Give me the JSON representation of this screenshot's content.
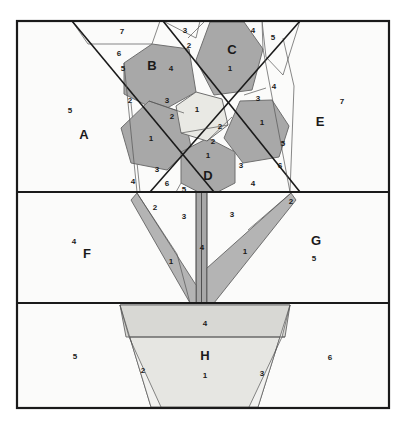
{
  "diagram": {
    "type": "quilt-foundation-piecing-diagram",
    "colors": {
      "background": "#ffffff",
      "block_fill": "#fbfbfa",
      "petal_fill": "#a8a8a8",
      "petal_stroke": "#6f6f6f",
      "leaf_fill": "#b4b4b4",
      "center_fill": "#e9e9e4",
      "pot_fill": "#e6e6e2",
      "pot_band_fill": "#d8d8d4",
      "outline": "#1a1a1a",
      "thin_line": "#444444",
      "text": "#1a1a1a"
    },
    "frame": {
      "x": 17,
      "y": 21,
      "width": 372,
      "height": 387
    },
    "dividers": [
      192,
      303
    ]
  },
  "sections": [
    {
      "id": "A",
      "label": "A",
      "x": 84,
      "y": 136,
      "piece": "5",
      "piece_x": 70,
      "piece_y": 111
    },
    {
      "id": "B",
      "label": "B",
      "x": 152,
      "y": 67,
      "piece": "4",
      "piece_x": 171,
      "piece_y": 69
    },
    {
      "id": "C",
      "label": "C",
      "x": 232,
      "y": 51,
      "piece": "1",
      "piece_x": 230,
      "piece_y": 69
    },
    {
      "id": "D",
      "label": "D",
      "x": 208,
      "y": 177,
      "piece": "1",
      "piece_x": 208,
      "piece_y": 156
    },
    {
      "id": "E",
      "label": "E",
      "x": 320,
      "y": 123,
      "piece": "7",
      "piece_x": 342,
      "piece_y": 102
    },
    {
      "id": "F",
      "label": "F",
      "x": 87,
      "y": 255,
      "piece": "4",
      "piece_x": 74,
      "piece_y": 242
    },
    {
      "id": "G",
      "label": "G",
      "x": 316,
      "y": 242,
      "piece": "5",
      "piece_x": 314,
      "piece_y": 259
    },
    {
      "id": "H",
      "label": "H",
      "x": 205,
      "y": 357,
      "piece": "1",
      "piece_x": 205,
      "piece_y": 376
    }
  ],
  "piece_numbers": [
    {
      "n": "7",
      "x": 122,
      "y": 32
    },
    {
      "n": "6",
      "x": 119,
      "y": 54
    },
    {
      "n": "5",
      "x": 123,
      "y": 69
    },
    {
      "n": "3",
      "x": 185,
      "y": 31
    },
    {
      "n": "2",
      "x": 189,
      "y": 46
    },
    {
      "n": "4",
      "x": 253,
      "y": 31
    },
    {
      "n": "5",
      "x": 273,
      "y": 38
    },
    {
      "n": "4",
      "x": 274,
      "y": 87
    },
    {
      "n": "3",
      "x": 258,
      "y": 99
    },
    {
      "n": "2",
      "x": 130,
      "y": 101
    },
    {
      "n": "3",
      "x": 167,
      "y": 101
    },
    {
      "n": "2",
      "x": 172,
      "y": 117
    },
    {
      "n": "1",
      "x": 197,
      "y": 110
    },
    {
      "n": "1",
      "x": 151,
      "y": 139
    },
    {
      "n": "2",
      "x": 220,
      "y": 127
    },
    {
      "n": "2",
      "x": 213,
      "y": 142
    },
    {
      "n": "1",
      "x": 262,
      "y": 123
    },
    {
      "n": "5",
      "x": 283,
      "y": 144
    },
    {
      "n": "6",
      "x": 280,
      "y": 166
    },
    {
      "n": "3",
      "x": 157,
      "y": 170
    },
    {
      "n": "4",
      "x": 133,
      "y": 182
    },
    {
      "n": "6",
      "x": 167,
      "y": 184
    },
    {
      "n": "5",
      "x": 184,
      "y": 190
    },
    {
      "n": "3",
      "x": 241,
      "y": 166
    },
    {
      "n": "4",
      "x": 253,
      "y": 184
    },
    {
      "n": "2",
      "x": 155,
      "y": 208
    },
    {
      "n": "3",
      "x": 184,
      "y": 217
    },
    {
      "n": "1",
      "x": 171,
      "y": 262
    },
    {
      "n": "4",
      "x": 202,
      "y": 248
    },
    {
      "n": "3",
      "x": 232,
      "y": 215
    },
    {
      "n": "1",
      "x": 245,
      "y": 252
    },
    {
      "n": "2",
      "x": 291,
      "y": 202
    },
    {
      "n": "4",
      "x": 205,
      "y": 324
    },
    {
      "n": "2",
      "x": 143,
      "y": 371
    },
    {
      "n": "3",
      "x": 262,
      "y": 374
    },
    {
      "n": "5",
      "x": 75,
      "y": 357
    },
    {
      "n": "6",
      "x": 330,
      "y": 358
    }
  ]
}
